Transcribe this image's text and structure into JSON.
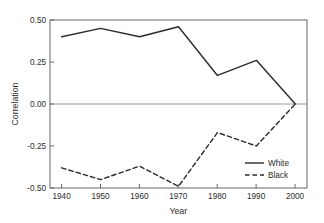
{
  "chart_data": {
    "type": "line",
    "title": "",
    "xlabel": "Year",
    "ylabel": "Correlation",
    "x": [
      1940,
      1950,
      1960,
      1970,
      1980,
      1990,
      2000
    ],
    "categories": [
      "1940",
      "1950",
      "1960",
      "1970",
      "1980",
      "1990",
      "2000"
    ],
    "series": [
      {
        "name": "White",
        "style": "solid",
        "color": "#2b2b2b",
        "values": [
          0.4,
          0.45,
          0.4,
          0.46,
          0.17,
          0.26,
          0.0
        ]
      },
      {
        "name": "Black",
        "style": "dashed",
        "color": "#2b2b2b",
        "values": [
          -0.38,
          -0.45,
          -0.37,
          -0.49,
          -0.17,
          -0.25,
          0.0
        ]
      }
    ],
    "xlim": [
      1937,
      2003
    ],
    "ylim": [
      -0.5,
      0.5
    ],
    "xticks": [
      1940,
      1950,
      1960,
      1970,
      1980,
      1990,
      2000
    ],
    "xtick_labels": [
      "1940",
      "1950",
      "1960",
      "1970",
      "1980",
      "1990",
      "2000"
    ],
    "yticks": [
      -0.5,
      -0.25,
      0.0,
      0.25,
      0.5
    ],
    "ytick_labels": [
      "-0.50",
      "-0.25",
      "0.00",
      "0.25",
      "0.50"
    ],
    "grid": false,
    "zero_line": true,
    "zero_line_color": "#999999",
    "legend_position": "bottom-right",
    "legend_entries": [
      "White",
      "Black"
    ],
    "frame_color": "#555555",
    "background": "#ffffff"
  },
  "axes": {
    "y_title": "Correlation",
    "x_title": "Year",
    "ytick_0": "0.50",
    "ytick_1": "0.25",
    "ytick_2": "0.00",
    "ytick_3": "-0.25",
    "ytick_4": "-0.50",
    "xtick_0": "1940",
    "xtick_1": "1950",
    "xtick_2": "1960",
    "xtick_3": "1970",
    "xtick_4": "1980",
    "xtick_5": "1990",
    "xtick_6": "2000"
  },
  "legend": {
    "entry_white": "White",
    "entry_black": "Black"
  }
}
